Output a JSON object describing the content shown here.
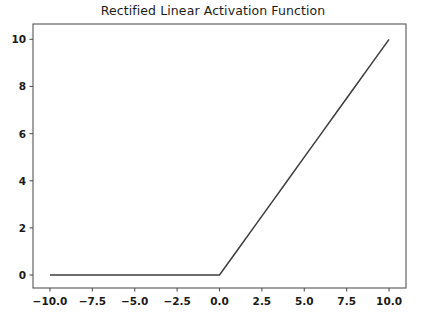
{
  "chart_data": {
    "type": "line",
    "title": "Rectified Linear Activation Function",
    "xlabel": "",
    "ylabel": "",
    "xlim": [
      -11.0,
      11.0
    ],
    "ylim": [
      -0.55,
      10.65
    ],
    "grid": false,
    "legend": null,
    "line_color": "#3c3c3c",
    "line_width": 1.5,
    "axes_color": "#555555",
    "background": "#ffffff",
    "xticks": [
      -10.0,
      -7.5,
      -5.0,
      -2.5,
      0.0,
      2.5,
      5.0,
      7.5,
      10.0
    ],
    "xtick_labels": [
      "−10.0",
      "−7.5",
      "−5.0",
      "−2.5",
      "0.0",
      "2.5",
      "5.0",
      "7.5",
      "10.0"
    ],
    "yticks": [
      0,
      2,
      4,
      6,
      8,
      10
    ],
    "ytick_labels": [
      "0",
      "2",
      "4",
      "6",
      "8",
      "10"
    ],
    "series": [
      {
        "name": "relu",
        "x": [
          -10.0,
          -9.0,
          -8.0,
          -7.0,
          -6.0,
          -5.0,
          -4.0,
          -3.0,
          -2.0,
          -1.0,
          0.0,
          1.0,
          2.0,
          3.0,
          4.0,
          5.0,
          6.0,
          7.0,
          8.0,
          9.0,
          10.0
        ],
        "y": [
          0.0,
          0.0,
          0.0,
          0.0,
          0.0,
          0.0,
          0.0,
          0.0,
          0.0,
          0.0,
          0.0,
          1.0,
          2.0,
          3.0,
          4.0,
          5.0,
          6.0,
          7.0,
          8.0,
          9.0,
          10.0
        ]
      }
    ]
  }
}
